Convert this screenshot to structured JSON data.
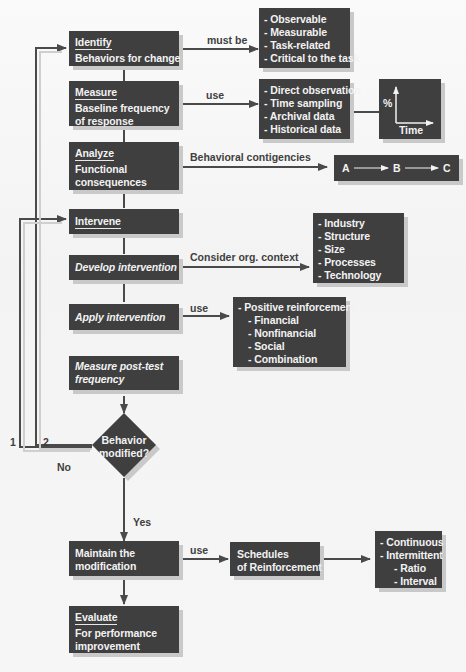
{
  "flowchart": {
    "main_steps": [
      {
        "id": "identify",
        "heading": "Identify",
        "text": [
          "Behaviors for change"
        ]
      },
      {
        "id": "measure",
        "heading": "Measure",
        "text": [
          "Baseline frequency",
          "of response"
        ]
      },
      {
        "id": "analyze",
        "heading": "Analyze",
        "text": [
          "Functional",
          "consequences"
        ]
      },
      {
        "id": "intervene",
        "heading": "Intervene",
        "text": []
      },
      {
        "id": "develop",
        "heading": "",
        "text": [
          "Develop intervention"
        ]
      },
      {
        "id": "apply",
        "heading": "",
        "text": [
          "Apply intervention"
        ]
      },
      {
        "id": "posttest",
        "heading": "",
        "text": [
          "Measure post-test",
          "frequency"
        ]
      },
      {
        "id": "maintain",
        "heading": "",
        "text": [
          "Maintain the",
          "modification"
        ]
      },
      {
        "id": "evaluate",
        "heading": "Evaluate",
        "text": [
          "For performance",
          "improvement"
        ]
      }
    ],
    "decision": {
      "text": [
        "Behavior",
        "modified?"
      ],
      "yes_label": "Yes",
      "no_label": "No"
    },
    "loop_labels": {
      "one": "1",
      "two": "2"
    },
    "edge_labels": {
      "identify": "must be",
      "measure": "use",
      "analyze": "Behavioral  contigencies",
      "develop": "Consider org. context",
      "apply": "use",
      "maintain": "use"
    },
    "side_boxes": {
      "criteria": [
        "- Observable",
        "- Measurable",
        "- Task-related",
        "- Critical to the task"
      ],
      "methods": [
        "- Direct observation",
        "- Time sampling",
        "- Archival data",
        "- Historical data"
      ],
      "graph": {
        "y_label": "%",
        "x_label": "Time"
      },
      "abc": {
        "a": "A",
        "b": "B",
        "c": "C"
      },
      "context": [
        "- Industry",
        "- Structure",
        "- Size",
        "- Processes",
        "- Technology"
      ],
      "reinforcement": {
        "main": "- Positive reinforcement",
        "sub": [
          "- Financial",
          "- Nonfinancial",
          "- Social",
          "- Combination"
        ]
      },
      "schedules": [
        "Schedules",
        "of Reinforcement"
      ],
      "schedule_types": {
        "main": [
          "- Continuous",
          "- Intermittent"
        ],
        "sub": [
          "- Ratio",
          "- Interval"
        ]
      }
    },
    "colors": {
      "box": "#3f3f40",
      "text": "#f2f2f2",
      "line": "#4a4a4b",
      "shadow": "#c9c9c9",
      "background": "#f6f6f6"
    }
  }
}
